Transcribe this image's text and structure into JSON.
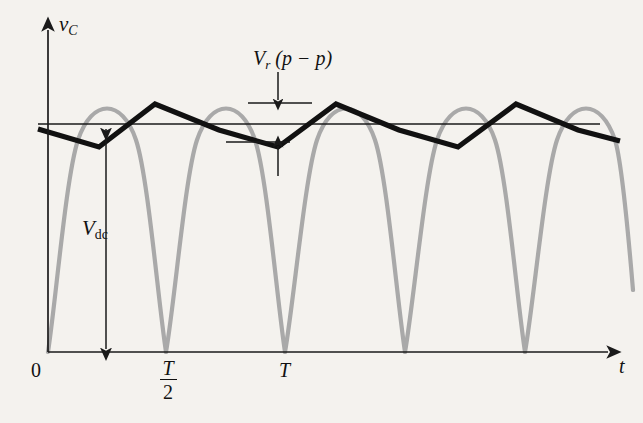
{
  "figure": {
    "background_color": "#f4f2ee",
    "axes": {
      "y_axis_label": "v",
      "y_axis_label_sub": "C",
      "x_axis_label": "t",
      "origin_label": "0",
      "axis_color": "#1a1a1a"
    },
    "ticks": [
      {
        "name": "half-period",
        "numerator": "T",
        "denominator": "2",
        "x": 166
      },
      {
        "name": "full-period",
        "label": "T",
        "x": 285
      }
    ],
    "annotations": {
      "vdc": {
        "label": "V",
        "label_sub": "dc",
        "description": "DC average output voltage, double-headed vertical arrow"
      },
      "ripple": {
        "label": "V",
        "label_sub": "r",
        "suffix": "(p − p)",
        "description": "Peak-to-peak ripple voltage measured between upper and lower ripple bounds"
      }
    },
    "waveforms": {
      "rectified_sine": {
        "name": "full-wave rectified sine",
        "color": "#a8a8a8",
        "stroke_width": 4,
        "peak_y": 112,
        "baseline_y": 352,
        "zero_crossings": [
          48,
          166,
          285,
          405,
          525,
          644
        ]
      },
      "ripple_sawtooth": {
        "name": "capacitor ripple voltage",
        "color": "#111111",
        "stroke_width": 5,
        "points": [
          [
            38,
            129
          ],
          [
            99,
            147
          ],
          [
            155,
            104
          ],
          [
            219,
            129
          ],
          [
            278,
            147
          ],
          [
            336,
            104
          ],
          [
            399,
            129
          ],
          [
            458,
            147
          ],
          [
            516,
            104
          ],
          [
            578,
            129
          ],
          [
            620,
            140
          ]
        ]
      },
      "vdc_level_line": {
        "name": "dc average reference line",
        "color": "#1a1a1a",
        "stroke_width": 1.3,
        "y": 124,
        "x_start": 38,
        "x_end": 600
      }
    },
    "measure_lines": {
      "upper_tick": {
        "y": 103,
        "x_start": 248,
        "x_end": 310
      },
      "lower_tick": {
        "y": 142,
        "x_start": 228,
        "x_end": 290
      },
      "arrow_x": 278,
      "top_arrow_from_y": 72,
      "bottom_arrow_from_y": 176
    }
  }
}
